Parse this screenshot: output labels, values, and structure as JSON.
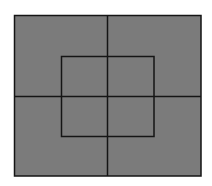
{
  "diagram": {
    "background": "#ffffff",
    "fill": "#7b7b7b",
    "stroke": "#151515",
    "outer_rect": {
      "x": 14.5,
      "y": 15.5,
      "width": 186.5,
      "height": 160.5
    },
    "inner_rect": {
      "x": 61.5,
      "y": 56.5,
      "width": 92.5,
      "height": 80
    },
    "vertical_line": {
      "x": 107.5,
      "y1": 15.5,
      "y2": 176
    },
    "horizontal_line": {
      "y": 96.5,
      "x1": 14.5,
      "x2": 201
    }
  }
}
